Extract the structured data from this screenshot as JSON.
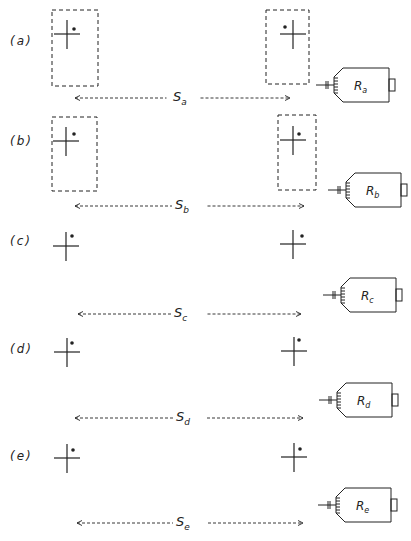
{
  "figure": {
    "type": "geometry-diagram",
    "stroke_color": "#222222",
    "background": "#ffffff",
    "panels": [
      {
        "id": "a",
        "label": "(a)",
        "top": 0,
        "left_frame": true,
        "right_frame": true,
        "left_cross": {
          "x": 67,
          "y": 34
        },
        "left_dot": {
          "x": 74,
          "y": 29
        },
        "right_cross": {
          "x": 293,
          "y": 34
        },
        "right_dot": {
          "x": 285,
          "y": 27
        },
        "left_frame_box": {
          "x": 52,
          "y": 10,
          "w": 46,
          "h": 76
        },
        "right_frame_box": {
          "x": 266,
          "y": 10,
          "w": 43,
          "h": 74
        },
        "separation": {
          "symbol": "S",
          "sub": "a",
          "y": 98,
          "x1": 75,
          "x2": 290
        },
        "receiver": {
          "symbol": "R",
          "sub": "a",
          "x": 320,
          "y": 68
        }
      },
      {
        "id": "b",
        "label": "(b)",
        "top": 110,
        "left_frame": true,
        "right_frame": true,
        "left_cross": {
          "x": 66,
          "y": 141
        },
        "left_dot": {
          "x": 74,
          "y": 134
        },
        "right_cross": {
          "x": 293,
          "y": 140
        },
        "right_dot": {
          "x": 299,
          "y": 134
        },
        "left_frame_box": {
          "x": 52,
          "y": 117,
          "w": 45,
          "h": 74
        },
        "right_frame_box": {
          "x": 278,
          "y": 115,
          "w": 38,
          "h": 75
        },
        "separation": {
          "symbol": "S",
          "sub": "b",
          "y": 206,
          "x1": 75,
          "x2": 304
        },
        "receiver": {
          "symbol": "R",
          "sub": "b",
          "x": 332,
          "y": 173
        }
      },
      {
        "id": "c",
        "label": "(c)",
        "top": 220,
        "left_frame": false,
        "right_frame": false,
        "left_cross": {
          "x": 66,
          "y": 246
        },
        "left_dot": {
          "x": 72,
          "y": 236
        },
        "right_cross": {
          "x": 293,
          "y": 244
        },
        "right_dot": {
          "x": 302,
          "y": 236
        },
        "separation": {
          "symbol": "S",
          "sub": "c",
          "y": 314,
          "x1": 78,
          "x2": 301
        },
        "receiver": {
          "symbol": "R",
          "sub": "c",
          "x": 327,
          "y": 278
        }
      },
      {
        "id": "d",
        "label": "(d)",
        "top": 330,
        "left_frame": false,
        "right_frame": false,
        "left_cross": {
          "x": 67,
          "y": 352
        },
        "left_dot": {
          "x": 72,
          "y": 343
        },
        "right_cross": {
          "x": 294,
          "y": 351
        },
        "right_dot": {
          "x": 299,
          "y": 340
        },
        "separation": {
          "symbol": "S",
          "sub": "d",
          "y": 418,
          "x1": 75,
          "x2": 303
        },
        "receiver": {
          "symbol": "R",
          "sub": "d",
          "x": 323,
          "y": 383
        }
      },
      {
        "id": "e",
        "label": "(e)",
        "top": 435,
        "left_frame": false,
        "right_frame": false,
        "left_cross": {
          "x": 67,
          "y": 458
        },
        "left_dot": {
          "x": 73,
          "y": 450
        },
        "right_cross": {
          "x": 294,
          "y": 457
        },
        "right_dot": {
          "x": 300,
          "y": 449
        },
        "separation": {
          "symbol": "S",
          "sub": "e",
          "y": 523,
          "x1": 77,
          "x2": 303
        },
        "receiver": {
          "symbol": "R",
          "sub": "e",
          "x": 322,
          "y": 488
        }
      }
    ]
  },
  "labels": {
    "a": "(a)",
    "b": "(b)",
    "c": "(c)",
    "d": "(d)",
    "e": "(e)",
    "s": "S",
    "r": "R",
    "sa": "a",
    "sb": "b",
    "sc": "c",
    "sd": "d",
    "se": "e"
  }
}
